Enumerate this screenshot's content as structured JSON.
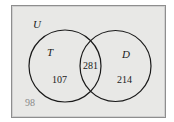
{
  "diagram": {
    "type": "venn",
    "universe_label": "U",
    "sets": [
      {
        "label": "T",
        "only_count": "107"
      },
      {
        "label": "D",
        "only_count": "214"
      }
    ],
    "intersection_count": "281",
    "outside_count": "98",
    "colors": {
      "background": "#e8e8e6",
      "outline": "#1a1a1a",
      "outside_text": "#8a8a8a"
    }
  }
}
